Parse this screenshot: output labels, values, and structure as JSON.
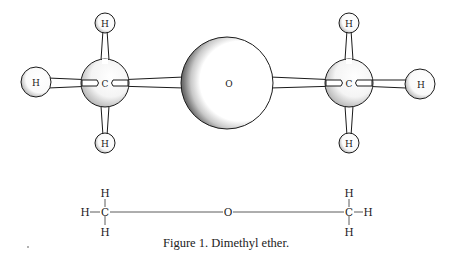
{
  "figure": {
    "caption": "Figure 1. Dimethyl ether.",
    "colors": {
      "ink": "#1a1a1a",
      "shading": "#555555",
      "background": "#ffffff"
    }
  },
  "ball_and_stick": {
    "atoms": [
      {
        "id": "h_left",
        "label": "H",
        "cx": 36,
        "cy": 82,
        "r": 15
      },
      {
        "id": "c_left",
        "label": "C",
        "cx": 105,
        "cy": 83,
        "r": 24
      },
      {
        "id": "h_left_top",
        "label": "H",
        "cx": 105,
        "cy": 23,
        "r": 10
      },
      {
        "id": "h_left_bot",
        "label": "H",
        "cx": 105,
        "cy": 143,
        "r": 10
      },
      {
        "id": "o_center",
        "label": "O",
        "cx": 227,
        "cy": 83,
        "r": 46
      },
      {
        "id": "c_right",
        "label": "C",
        "cx": 349,
        "cy": 83,
        "r": 24
      },
      {
        "id": "h_right",
        "label": "H",
        "cx": 420,
        "cy": 84,
        "r": 15
      },
      {
        "id": "h_right_top",
        "label": "H",
        "cx": 349,
        "cy": 23,
        "r": 10
      },
      {
        "id": "h_right_bot",
        "label": "H",
        "cx": 349,
        "cy": 143,
        "r": 10
      }
    ],
    "labels": {
      "h_left": "H",
      "c_left": "C",
      "h_left_top": "H",
      "h_left_bot": "H",
      "o_center": "O",
      "c_right": "C",
      "h_right": "H",
      "h_right_top": "H",
      "h_right_bot": "H"
    }
  },
  "structural_formula": {
    "left_methyl": {
      "top": "H",
      "left": "H",
      "center": "C",
      "bottom": "H"
    },
    "oxygen": "O",
    "right_methyl": {
      "top": "H",
      "right": "H",
      "center": "C",
      "bottom": "H"
    }
  }
}
